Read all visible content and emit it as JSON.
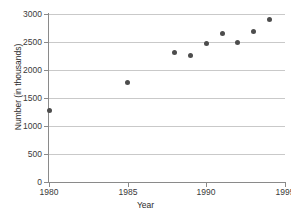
{
  "chart_data": {
    "type": "scatter",
    "title": "",
    "xlabel": "Year",
    "ylabel": "Number (in thousands)",
    "xlim": [
      1980,
      1995
    ],
    "ylim": [
      0,
      3000
    ],
    "xticks": [
      1980,
      1985,
      1990,
      1995
    ],
    "yticks": [
      0,
      500,
      1000,
      1500,
      2000,
      2500,
      3000
    ],
    "grid": "horizontal",
    "legend": "none",
    "marker_color": "#4d4d4d",
    "grid_color": "#c9c9c9",
    "axis_color": "#8a8a8a",
    "x": [
      1980,
      1985,
      1988,
      1989,
      1990,
      1991,
      1992,
      1993,
      1994
    ],
    "y": [
      1280,
      1770,
      2320,
      2260,
      2480,
      2650,
      2500,
      2680,
      2900
    ],
    "points": [
      {
        "x": 1980,
        "y": 1280
      },
      {
        "x": 1985,
        "y": 1770
      },
      {
        "x": 1988,
        "y": 2320
      },
      {
        "x": 1989,
        "y": 2260
      },
      {
        "x": 1990,
        "y": 2480
      },
      {
        "x": 1991,
        "y": 2650
      },
      {
        "x": 1992,
        "y": 2500
      },
      {
        "x": 1993,
        "y": 2680
      },
      {
        "x": 1994,
        "y": 2900
      }
    ]
  },
  "axis": {
    "x_title": "Year",
    "y_title": "Number (in thousands)",
    "x_tick_labels": [
      "1980",
      "1985",
      "1990",
      "1995"
    ],
    "y_tick_labels": [
      "0",
      "500",
      "1000",
      "1500",
      "2000",
      "2500",
      "3000"
    ]
  }
}
